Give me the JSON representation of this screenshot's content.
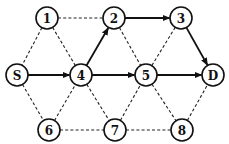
{
  "diagram": {
    "type": "graph",
    "colors": {
      "line": "#111111",
      "node_fill": "#ffffff"
    },
    "nodes": [
      {
        "id": "1",
        "label": "1"
      },
      {
        "id": "2",
        "label": "2"
      },
      {
        "id": "3",
        "label": "3"
      },
      {
        "id": "S",
        "label": "S"
      },
      {
        "id": "4",
        "label": "4"
      },
      {
        "id": "5",
        "label": "5"
      },
      {
        "id": "D",
        "label": "D"
      },
      {
        "id": "6",
        "label": "6"
      },
      {
        "id": "7",
        "label": "7"
      },
      {
        "id": "8",
        "label": "8"
      }
    ],
    "edges": [
      {
        "from": "1",
        "to": "2",
        "style": "dashed",
        "directed": false
      },
      {
        "from": "1",
        "to": "S",
        "style": "dashed",
        "directed": false
      },
      {
        "from": "1",
        "to": "4",
        "style": "dashed",
        "directed": false
      },
      {
        "from": "2",
        "to": "5",
        "style": "dashed",
        "directed": false
      },
      {
        "from": "3",
        "to": "5",
        "style": "dashed",
        "directed": false
      },
      {
        "from": "S",
        "to": "6",
        "style": "dashed",
        "directed": false
      },
      {
        "from": "6",
        "to": "4",
        "style": "dashed",
        "directed": false
      },
      {
        "from": "4",
        "to": "7",
        "style": "dashed",
        "directed": false
      },
      {
        "from": "6",
        "to": "7",
        "style": "dashed",
        "directed": false
      },
      {
        "from": "7",
        "to": "5",
        "style": "dashed",
        "directed": false
      },
      {
        "from": "5",
        "to": "8",
        "style": "dashed",
        "directed": false
      },
      {
        "from": "7",
        "to": "8",
        "style": "dashed",
        "directed": false
      },
      {
        "from": "8",
        "to": "D",
        "style": "dashed",
        "directed": false
      },
      {
        "from": "S",
        "to": "4",
        "style": "solid",
        "directed": true
      },
      {
        "from": "4",
        "to": "2",
        "style": "solid",
        "directed": true
      },
      {
        "from": "2",
        "to": "3",
        "style": "solid",
        "directed": true
      },
      {
        "from": "3",
        "to": "D",
        "style": "solid",
        "directed": true
      },
      {
        "from": "4",
        "to": "5",
        "style": "solid",
        "directed": true
      },
      {
        "from": "5",
        "to": "D",
        "style": "solid",
        "directed": true
      }
    ]
  }
}
